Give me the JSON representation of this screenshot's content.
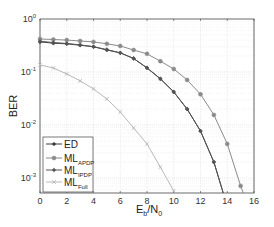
{
  "chart_data": {
    "type": "line",
    "title": "",
    "xlabel": "E_b/N_0",
    "xlabel_main": "E",
    "xlabel_sub1": "b",
    "xlabel_mid": "/N",
    "xlabel_sub2": "0",
    "ylabel": "BER",
    "xlim": [
      0,
      16
    ],
    "ylim": [
      0.0005,
      1
    ],
    "yscale": "log",
    "grid": true,
    "legend_position": "lower left",
    "xticks": [
      0,
      2,
      4,
      6,
      8,
      10,
      12,
      14,
      16
    ],
    "yticks": [
      {
        "base": "10",
        "exp": "0",
        "value": 1
      },
      {
        "base": "10",
        "exp": "-1",
        "value": 0.1
      },
      {
        "base": "10",
        "exp": "-2",
        "value": 0.01
      },
      {
        "base": "10",
        "exp": "-3",
        "value": 0.001
      }
    ],
    "series": [
      {
        "name": "ED",
        "label_main": "ED",
        "label_sub": "",
        "color": "#3a3a3a",
        "marker": "asterisk",
        "x": [
          0,
          1,
          2,
          3,
          4,
          5,
          6,
          7,
          8,
          9,
          10,
          11,
          12,
          13,
          13.7
        ],
        "values": [
          0.37,
          0.35,
          0.34,
          0.32,
          0.3,
          0.26,
          0.23,
          0.18,
          0.119,
          0.074,
          0.042,
          0.02,
          0.0077,
          0.002,
          0.0005
        ]
      },
      {
        "name": "ML_APDP",
        "label_main": "ML",
        "label_sub": "APDP",
        "color": "#8a8a8a",
        "marker": "circle",
        "x": [
          0,
          1,
          2,
          3,
          4,
          5,
          6,
          7,
          8,
          9,
          10,
          11,
          12,
          13,
          14,
          15,
          15.2
        ],
        "values": [
          0.42,
          0.41,
          0.4,
          0.385,
          0.37,
          0.34,
          0.31,
          0.26,
          0.22,
          0.16,
          0.114,
          0.071,
          0.038,
          0.0155,
          0.0044,
          0.00071,
          0.0005
        ]
      },
      {
        "name": "ML_IPDP",
        "label_main": "ML",
        "label_sub": "IPDP",
        "color": "#555555",
        "marker": "diamond",
        "x": [
          0,
          1,
          2,
          3,
          4,
          5,
          6,
          7,
          8,
          9,
          10,
          11,
          12,
          13,
          13.7
        ],
        "values": [
          0.38,
          0.36,
          0.345,
          0.325,
          0.3,
          0.265,
          0.23,
          0.18,
          0.12,
          0.075,
          0.042,
          0.02,
          0.0077,
          0.002,
          0.0005
        ]
      },
      {
        "name": "ML_Full",
        "label_main": "ML",
        "label_sub": "Full",
        "color": "#b8b8b8",
        "marker": "x",
        "x": [
          0,
          1,
          2,
          3,
          4,
          5,
          6,
          7,
          8,
          9,
          10
        ],
        "values": [
          0.136,
          0.119,
          0.092,
          0.068,
          0.048,
          0.031,
          0.0176,
          0.0088,
          0.0044,
          0.0016,
          0.00057
        ]
      }
    ]
  }
}
